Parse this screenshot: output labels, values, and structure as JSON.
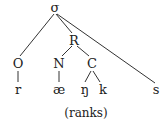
{
  "diagram": {
    "type": "syllable-tree",
    "caption": "(ranks)",
    "nodes": {
      "syllable": "σ",
      "rhyme": "R",
      "onset": "O",
      "nucleus": "N",
      "coda": "C",
      "seg_r": "r",
      "seg_ae": "æ",
      "seg_ng": "ŋ",
      "seg_k": "k",
      "seg_s": "s"
    },
    "edges": [
      [
        "σ",
        "O"
      ],
      [
        "σ",
        "R"
      ],
      [
        "σ",
        "s"
      ],
      [
        "R",
        "N"
      ],
      [
        "R",
        "C"
      ],
      [
        "O",
        "r"
      ],
      [
        "N",
        "æ"
      ],
      [
        "C",
        "ŋ"
      ],
      [
        "C",
        "k"
      ]
    ]
  }
}
